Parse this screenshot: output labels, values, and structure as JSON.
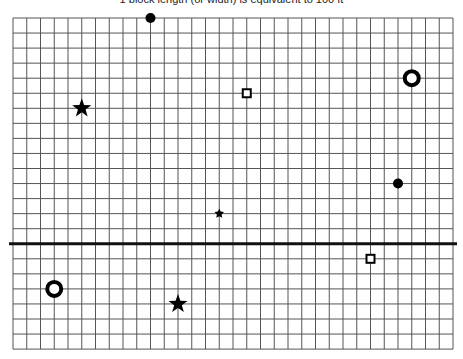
{
  "caption": "1 block length (or width) is equivalent to 100 ft",
  "grid": {
    "left": 13,
    "top": 18,
    "cols": 32,
    "rows": 22,
    "cell_w": 13.75,
    "cell_h": 15.05,
    "line_color": "#555555",
    "axis_row": 15,
    "axis_color": "#111111"
  },
  "markers": [
    {
      "type": "dot",
      "col": 10,
      "row": 0
    },
    {
      "type": "star",
      "col": 5,
      "row": 6
    },
    {
      "type": "square",
      "col": 17,
      "row": 5
    },
    {
      "type": "ring",
      "col": 29,
      "row": 4
    },
    {
      "type": "dot",
      "col": 28,
      "row": 11
    },
    {
      "type": "asterisk",
      "col": 15,
      "row": 13
    },
    {
      "type": "square",
      "col": 26,
      "row": 16
    },
    {
      "type": "ring",
      "col": 3,
      "row": 18
    },
    {
      "type": "star",
      "col": 12,
      "row": 19
    }
  ]
}
